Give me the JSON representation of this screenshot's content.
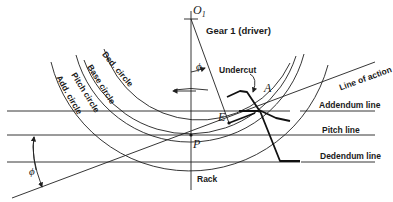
{
  "diagram": {
    "title": "Gear 1 (driver)",
    "center_label": "O",
    "center_subscript": "1",
    "point_labels": {
      "pitch_point": "P",
      "base_tangent_point": "E",
      "interference_point": "A"
    },
    "angle_symbol": "ϕ",
    "circles": [
      {
        "name": "Ded. circle"
      },
      {
        "name": "Base circle"
      },
      {
        "name": "Pitch circle"
      },
      {
        "name": "Add. circle"
      }
    ],
    "lines": {
      "line_of_action": "Line of action",
      "addendum": "Addendum line",
      "pitch": "Pitch line",
      "dedendum": "Dedendum line"
    },
    "annotations": {
      "undercut": "Undercut",
      "rack": "Rack"
    },
    "colors": {
      "line": "#1f1f1f",
      "background": "#ffffff"
    }
  }
}
